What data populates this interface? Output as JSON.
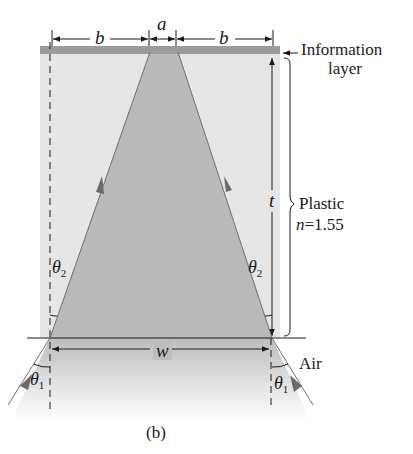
{
  "diagram": {
    "caption": "(b)",
    "labels": {
      "b_left": "b",
      "a": "a",
      "b_right": "b",
      "information_layer_line1": "Information",
      "information_layer_line2": "layer",
      "t": "t",
      "plastic": "Plastic",
      "n_symbol": "n",
      "n_value": "=1.55",
      "theta2_left": "θ",
      "theta2_left_sub": "2",
      "theta2_right": "θ",
      "theta2_right_sub": "2",
      "w": "w",
      "air": "Air",
      "theta1_left": "θ",
      "theta1_left_sub": "1",
      "theta1_right": "θ",
      "theta1_right_sub": "1"
    },
    "colors": {
      "plastic_fill": "#e4e4e4",
      "cone_fill": "#b9b9b9",
      "info_layer": "#9a9a9a",
      "ray": "#6e6e6e",
      "arrowhead": "#6a6a6a",
      "line": "#1a1a1a"
    }
  }
}
